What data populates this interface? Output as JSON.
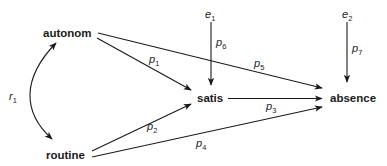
{
  "diagram": {
    "type": "path-diagram",
    "nodes": {
      "autonom": {
        "label": "autonom"
      },
      "routine": {
        "label": "routine"
      },
      "satis": {
        "label": "satis"
      },
      "absence": {
        "label": "absence"
      },
      "e1": {
        "label": "e",
        "sub": "1"
      },
      "e2": {
        "label": "e",
        "sub": "2"
      }
    },
    "edges": {
      "r1": {
        "label": "r",
        "sub": "1",
        "from": "autonom",
        "to": "routine",
        "kind": "bidirectional-curve"
      },
      "p1": {
        "label": "p",
        "sub": "1",
        "from": "autonom",
        "to": "satis"
      },
      "p2": {
        "label": "p",
        "sub": "2",
        "from": "routine",
        "to": "satis"
      },
      "p3": {
        "label": "p",
        "sub": "3",
        "from": "satis",
        "to": "absence"
      },
      "p4": {
        "label": "p",
        "sub": "4",
        "from": "routine",
        "to": "absence"
      },
      "p5": {
        "label": "p",
        "sub": "5",
        "from": "autonom",
        "to": "absence"
      },
      "p6": {
        "label": "p",
        "sub": "6",
        "from": "e1",
        "to": "satis"
      },
      "p7": {
        "label": "p",
        "sub": "7",
        "from": "e2",
        "to": "absence"
      }
    }
  }
}
